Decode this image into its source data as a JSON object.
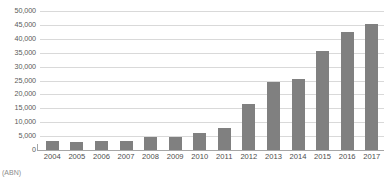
{
  "chart_data": {
    "type": "bar",
    "title": "",
    "subtitle": "",
    "xlabel": "",
    "ylabel": "",
    "categories": [
      "2004",
      "2005",
      "2006",
      "2007",
      "2008",
      "2009",
      "2010",
      "2011",
      "2012",
      "2013",
      "2014",
      "2015",
      "2016",
      "2017"
    ],
    "values": [
      3200,
      2800,
      3100,
      3100,
      4700,
      4700,
      6000,
      8000,
      16500,
      24500,
      25500,
      35500,
      42500,
      45500
    ],
    "series": [
      {
        "name": "",
        "values": [
          3200,
          2800,
          3100,
          3100,
          4700,
          4700,
          6000,
          8000,
          16500,
          24500,
          25500,
          35500,
          42500,
          45500
        ]
      }
    ],
    "ylim": [
      0,
      50000
    ],
    "ytick_values": [
      0,
      5000,
      10000,
      15000,
      20000,
      25000,
      30000,
      35000,
      40000,
      45000,
      50000
    ],
    "ytick_labels": [
      "0",
      "5,000",
      "10,000",
      "15,000",
      "20,000",
      "25,000",
      "30,000",
      "35,000",
      "40,000",
      "45,000",
      "50,000"
    ],
    "grid": true,
    "grid_axis": "y",
    "legend": false,
    "legend_position": "none",
    "bar_color": "#808080",
    "gridline_color": "#d9d9d9",
    "axis_color": "#a6a6a6",
    "background_color": "#ffffff"
  },
  "caption": {
    "text": "(ABN)"
  }
}
